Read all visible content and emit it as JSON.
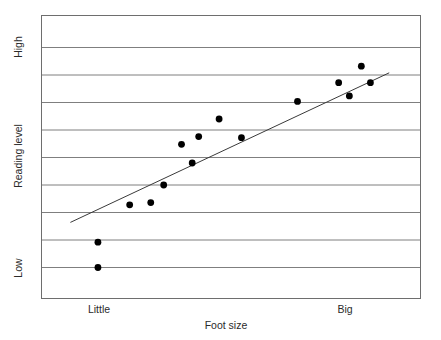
{
  "chart_data": {
    "type": "scatter",
    "title": "",
    "xlabel": "Foot size",
    "ylabel": "Reading level",
    "x_tick_labels": [
      "Little",
      "Big"
    ],
    "y_tick_labels": [
      "High",
      "Low"
    ],
    "grid": true,
    "gridlines": 9,
    "legend": "none",
    "xlim": [
      0,
      10
    ],
    "ylim": [
      0,
      10
    ],
    "axis_type": "ordinal-qualitative",
    "points": [
      {
        "x": 0.97,
        "y": 1.15
      },
      {
        "x": 0.97,
        "y": 0.0
      },
      {
        "x": 1.95,
        "y": 2.85
      },
      {
        "x": 2.6,
        "y": 2.95
      },
      {
        "x": 3.0,
        "y": 3.75
      },
      {
        "x": 3.55,
        "y": 5.6
      },
      {
        "x": 3.88,
        "y": 4.75
      },
      {
        "x": 4.08,
        "y": 5.95
      },
      {
        "x": 4.71,
        "y": 6.75
      },
      {
        "x": 5.4,
        "y": 5.9
      },
      {
        "x": 7.13,
        "y": 7.55
      },
      {
        "x": 9.1,
        "y": 9.15
      },
      {
        "x": 8.4,
        "y": 8.4
      },
      {
        "x": 8.73,
        "y": 7.8
      },
      {
        "x": 9.38,
        "y": 8.4
      }
    ],
    "trendline": {
      "x_start": 0.12,
      "y_start": 2.05,
      "x_end": 9.96,
      "y_end": 8.85,
      "style": "solid"
    },
    "colors": {
      "point": "#000000",
      "gridline": "#7f7f7f",
      "axis": "#6e6e6e",
      "trendline": "#3a3a3a",
      "text": "#2b2b2b",
      "background": "#ffffff"
    }
  }
}
